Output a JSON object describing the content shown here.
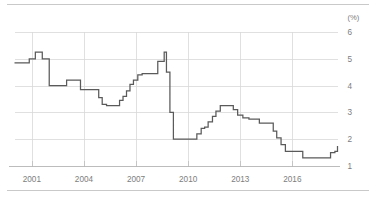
{
  "chart_data": {
    "type": "line",
    "title": "",
    "subtitle": "",
    "xlabel": "",
    "ylabel": "",
    "unit_label": "(%)",
    "xlim": [
      2000.0,
      2018.6
    ],
    "ylim": [
      1,
      6
    ],
    "y_ticks": [
      6,
      5,
      4,
      3,
      2,
      1
    ],
    "y_tick_labels": [
      "6",
      "5",
      "4",
      "3",
      "2",
      "1"
    ],
    "x_ticks": [
      2001,
      2004,
      2007,
      2010,
      2013,
      2016
    ],
    "x_tick_labels": [
      "2001",
      "2004",
      "2007",
      "2010",
      "2013",
      "2016"
    ],
    "grid": "horizontal",
    "legend": "none",
    "step_style": "post",
    "series": [
      {
        "name": "rate",
        "color": "#5a5a5a",
        "x": [
          2000.0,
          2000.55,
          2000.85,
          2001.0,
          2001.2,
          2001.45,
          2001.6,
          2002.0,
          2002.6,
          2003.0,
          2003.45,
          2003.8,
          2004.25,
          2004.6,
          2004.85,
          2005.05,
          2005.3,
          2005.85,
          2006.05,
          2006.25,
          2006.45,
          2006.65,
          2006.85,
          2007.1,
          2007.35,
          2007.7,
          2008.25,
          2008.5,
          2008.62,
          2008.75,
          2008.95,
          2009.15,
          2010.3,
          2010.5,
          2010.75,
          2010.95,
          2011.15,
          2011.4,
          2011.6,
          2011.85,
          2012.35,
          2012.6,
          2012.85,
          2013.15,
          2013.5,
          2014.1,
          2014.45,
          2014.7,
          2014.9,
          2015.1,
          2015.35,
          2015.6,
          2016.35,
          2016.6,
          2017.9,
          2018.2,
          2018.45,
          2018.6
        ],
        "values": [
          4.85,
          4.85,
          5.0,
          5.0,
          5.25,
          5.25,
          5.0,
          4.0,
          4.0,
          4.2,
          4.2,
          3.85,
          3.85,
          3.85,
          3.55,
          3.3,
          3.25,
          3.25,
          3.45,
          3.6,
          3.8,
          4.05,
          4.2,
          4.4,
          4.45,
          4.45,
          4.9,
          4.9,
          5.25,
          4.5,
          3.0,
          2.0,
          2.0,
          2.2,
          2.4,
          2.45,
          2.65,
          2.85,
          3.05,
          3.25,
          3.25,
          3.1,
          2.9,
          2.8,
          2.75,
          2.6,
          2.6,
          2.6,
          2.3,
          2.05,
          1.8,
          1.55,
          1.55,
          1.3,
          1.3,
          1.5,
          1.55,
          1.75
        ]
      }
    ],
    "annotations": []
  },
  "axes": {
    "unit_label": "(%)"
  }
}
